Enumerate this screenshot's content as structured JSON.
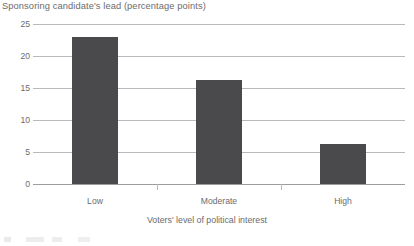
{
  "chart_data": {
    "type": "bar",
    "title": "Sponsoring candidate's lead (percentage points)",
    "xlabel": "Voters' level of political interest",
    "ylabel": "",
    "categories": [
      "Low",
      "Moderate",
      "High"
    ],
    "values": [
      23.0,
      16.2,
      6.3
    ],
    "ylim": [
      0,
      25
    ],
    "yticks": [
      0,
      5,
      10,
      15,
      20,
      25
    ],
    "ytick_labels": [
      "0",
      "5",
      "10",
      "15",
      "20",
      "25"
    ],
    "grid": "horizontal",
    "legend": "none",
    "bar_color": "#4a4a4c",
    "gridline_color": "#b9b9bb",
    "text_color": "#6b6b6d"
  }
}
